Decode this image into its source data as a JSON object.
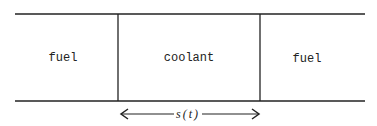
{
  "diagram": {
    "regions": [
      {
        "label": "fuel"
      },
      {
        "label": "coolant"
      },
      {
        "label": "fuel"
      }
    ],
    "dimension_label": "s(t)"
  }
}
